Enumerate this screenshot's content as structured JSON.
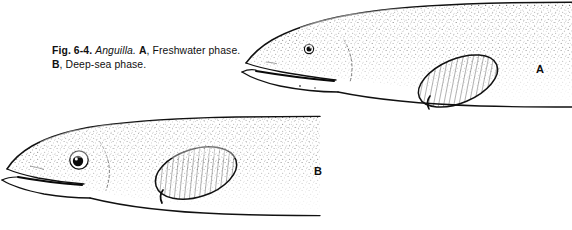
{
  "figure": {
    "caption": {
      "fig_number": "Fig. 6-4.",
      "genus": "Anguilla.",
      "part_a_label": "A",
      "part_a_text": ", Freshwater phase.",
      "part_b_label": "B",
      "part_b_text": ", Deep-sea phase.",
      "full_text": "Fig. 6-4. Anguilla. A, Freshwater phase. B, Deep-sea phase."
    },
    "panels": [
      {
        "id": "A",
        "label": "A",
        "subject": "Anguilla freshwater phase",
        "description": "Lateral view of eel head and anterior body, small eye, pointed snout, elongated lower jaw, hatched pectoral fin, stippled body shading",
        "eye_diameter_px": 9,
        "position": "upper-right"
      },
      {
        "id": "B",
        "label": "B",
        "subject": "Anguilla deep-sea phase",
        "description": "Lateral view of eel head and anterior body, greatly enlarged eye, blunter snout, hatched pectoral fin, stippled body shading",
        "eye_diameter_px": 18,
        "position": "lower-left"
      }
    ],
    "colors": {
      "ink": "#111111",
      "background": "#ffffff",
      "stipple": "#2a2a2a"
    }
  }
}
